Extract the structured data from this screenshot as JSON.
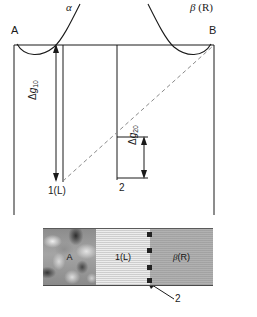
{
  "figure": {
    "type": "free-energy-diagram-with-micrograph",
    "top_left_label": "A",
    "top_right_label": "B",
    "curve_alpha_label": "α",
    "curve_beta_label": "β (R)",
    "delta_g10": {
      "symbol": "Δg",
      "subscript": "10"
    },
    "delta_g20": {
      "symbol": "Δg",
      "subscript": "20"
    },
    "phase_1_label": "1(L)",
    "callout_2_label": "2",
    "micrograph": {
      "segments": [
        {
          "label": "A",
          "name": "phase-a"
        },
        {
          "label": "1(L)",
          "name": "phase-1-liquid"
        },
        {
          "label": "β(R)",
          "name": "phase-beta-r"
        }
      ],
      "interface_marker_count": 4,
      "callout_label": "2"
    },
    "colors": {
      "line": "#1a1a1a",
      "dashed": "#8a8a8a",
      "phase_a_fill": "#9a9a9a",
      "phase_l_fill": "#d6d6d6",
      "phase_r_fill": "#a8a8a8",
      "marker": "#222222"
    }
  }
}
